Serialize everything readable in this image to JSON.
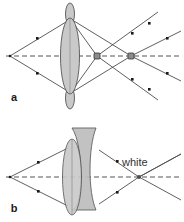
{
  "figure": {
    "title": "",
    "background_color": "#ffffff",
    "width": 184,
    "height": 222
  },
  "colors": {
    "ray_stroke": "#4d4d4d",
    "axis_stroke": "#555555",
    "lens_fill": "#c9c9c9",
    "lens_fill_secondary": "#bdbdbd",
    "lens_stroke": "#555555",
    "marker_fill": "#1a1a1a",
    "focus_marker_fill": "#8c8c8c",
    "focus_marker_stroke": "#333333",
    "label_color": "#1a1a1a",
    "annotation_color": "#333333"
  },
  "panels": [
    {
      "id": "panel-a",
      "label": "a",
      "label_x": 14,
      "label_y": 100,
      "description": "Uncorrected lens: converging rays cross the optical axis at two separate focus points, producing chromatic aberration; rays continue diverging to the right.",
      "axis": {
        "name": "optical-axis",
        "style": "dashed",
        "x1": 6,
        "y1": 56,
        "x2": 180,
        "y2": 56
      },
      "source_point": {
        "x": 10,
        "y": 56
      },
      "lens": {
        "type": "double-convex-compound",
        "center_x": 70,
        "center_y": 56,
        "body_rx": 9,
        "body_ry": 37,
        "tip_rx": 4,
        "tip_ry": 11,
        "tip_top_y": 14,
        "tip_bottom_y": 98
      },
      "focus_points": [
        {
          "name": "focus-near",
          "x": 97,
          "y": 56,
          "size": 6
        },
        {
          "name": "focus-far",
          "x": 131,
          "y": 56,
          "size": 6
        }
      ],
      "incoming_rays": [
        {
          "from": [
            10,
            56
          ],
          "to": [
            66,
            22
          ],
          "marker_at": [
            38,
            39
          ]
        },
        {
          "from": [
            10,
            56
          ],
          "to": [
            66,
            90
          ],
          "marker_at": [
            38,
            73
          ]
        }
      ],
      "outgoing_rays": [
        {
          "from": [
            74,
            22
          ],
          "to": [
            131,
            56
          ]
        },
        {
          "from": [
            74,
            90
          ],
          "to": [
            131,
            56
          ]
        },
        {
          "from": [
            74,
            24
          ],
          "to": [
            97,
            56
          ]
        },
        {
          "from": [
            74,
            88
          ],
          "to": [
            97,
            56
          ]
        },
        {
          "from": [
            97,
            56
          ],
          "to": [
            156,
            14
          ]
        },
        {
          "from": [
            97,
            56
          ],
          "to": [
            156,
            98
          ]
        },
        {
          "from": [
            131,
            56
          ],
          "to": [
            180,
            32
          ]
        },
        {
          "from": [
            131,
            56
          ],
          "to": [
            180,
            80
          ]
        }
      ],
      "ray_markers": [
        {
          "x": 38,
          "y": 39
        },
        {
          "x": 38,
          "y": 73
        },
        {
          "x": 132,
          "y": 33
        },
        {
          "x": 132,
          "y": 79
        },
        {
          "x": 166,
          "y": 39
        },
        {
          "x": 166,
          "y": 73
        }
      ]
    },
    {
      "id": "panel-b",
      "label": "b",
      "label_x": 14,
      "label_y": 211,
      "description": "Achromatic doublet: the corrective element brings all colours to a single common focus producing white light at one point.",
      "annotation": {
        "name": "white-light-label",
        "text": "white",
        "x": 122,
        "y": 164
      },
      "axis": {
        "name": "optical-axis",
        "style": "dashed",
        "x1": 6,
        "y1": 177,
        "x2": 180,
        "y2": 177
      },
      "source_point": {
        "x": 10,
        "y": 177
      },
      "lens": {
        "type": "achromatic-doublet",
        "front_center_x": 72,
        "front_center_y": 177,
        "front_rx": 9,
        "front_ry": 37,
        "rear_left_x": 72,
        "rear_right_x": 96,
        "rear_top_y": 128,
        "rear_bottom_y": 210
      },
      "focus_points": [
        {
          "name": "common-focus",
          "x": 139,
          "y": 177,
          "size": 4
        }
      ],
      "incoming_rays": [
        {
          "from": [
            10,
            177
          ],
          "to": [
            66,
            150
          ],
          "marker_at": [
            38,
            163
          ]
        },
        {
          "from": [
            10,
            177
          ],
          "to": [
            66,
            204
          ],
          "marker_at": [
            38,
            191
          ]
        }
      ],
      "outgoing_rays": [
        {
          "from": [
            97,
            150
          ],
          "to": [
            139,
            177
          ]
        },
        {
          "from": [
            97,
            204
          ],
          "to": [
            139,
            177
          ]
        },
        {
          "from": [
            139,
            177
          ],
          "to": [
            180,
            155
          ]
        },
        {
          "from": [
            139,
            177
          ],
          "to": [
            180,
            199
          ]
        }
      ],
      "ray_markers": [
        {
          "x": 38,
          "y": 163
        },
        {
          "x": 38,
          "y": 191
        },
        {
          "x": 116,
          "y": 163
        },
        {
          "x": 116,
          "y": 191
        }
      ]
    }
  ]
}
